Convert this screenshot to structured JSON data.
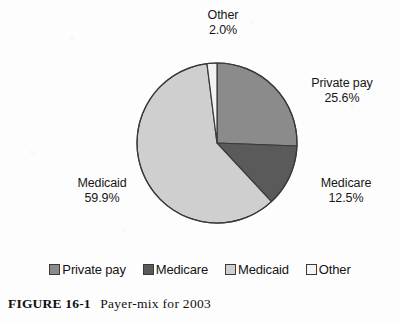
{
  "figure": {
    "caption_label": "FIGURE 16-1",
    "caption_title": "Payer-mix for 2003"
  },
  "chart_data": {
    "type": "pie",
    "title": "Payer-mix for 2003",
    "units": "percent",
    "legend_position": "bottom",
    "start_angle_deg": 0,
    "direction": "clockwise",
    "categories": [
      "Private pay",
      "Medicare",
      "Medicaid",
      "Other"
    ],
    "values": [
      25.6,
      12.5,
      59.9,
      2.0
    ],
    "colors": [
      "#8b8b8b",
      "#5a5a5a",
      "#cfcfcf",
      "#f2f2f2"
    ],
    "slice_outline_color": "#3a3a3a",
    "labels": [
      {
        "name": "Private pay",
        "value": "25.6%",
        "position": "right-upper"
      },
      {
        "name": "Medicare",
        "value": "12.5%",
        "position": "right-lower"
      },
      {
        "name": "Medicaid",
        "value": "59.9%",
        "position": "left"
      },
      {
        "name": "Other",
        "value": "2.0%",
        "position": "top"
      }
    ]
  },
  "legend": {
    "items": [
      {
        "label": "Private pay",
        "color": "#8b8b8b"
      },
      {
        "label": "Medicare",
        "color": "#5a5a5a"
      },
      {
        "label": "Medicaid",
        "color": "#cfcfcf"
      },
      {
        "label": "Other",
        "color": "#f5f5f5"
      }
    ]
  }
}
